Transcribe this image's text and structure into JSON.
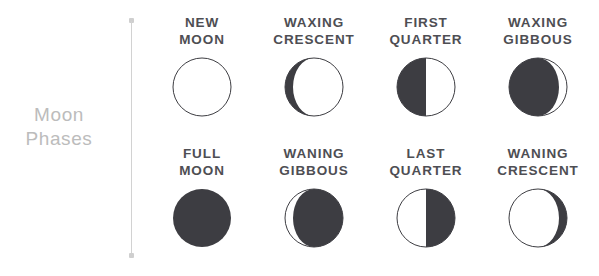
{
  "title": {
    "line1": "Moon",
    "line2": "Phases",
    "color": "#bcbcbc"
  },
  "divider": {
    "line_color": "#d2d2d2",
    "dot_color": "#cfcfcf"
  },
  "colors": {
    "dark_fill": "#3d3d42",
    "outline": "#3d3d42",
    "label": "#4e4e53",
    "background": "#ffffff"
  },
  "phases": [
    {
      "label_line1": "NEW",
      "label_line2": "MOON",
      "icon": "new-moon-icon",
      "illumination": 0,
      "shape": "empty-circle"
    },
    {
      "label_line1": "WAXING",
      "label_line2": "CRESCENT",
      "icon": "waxing-crescent-moon-icon",
      "illumination": 15,
      "shape": "dark-with-light-sliver-right"
    },
    {
      "label_line1": "FIRST",
      "label_line2": "QUARTER",
      "icon": "first-quarter-moon-icon",
      "illumination": 50,
      "shape": "left-half-dark"
    },
    {
      "label_line1": "WAXING",
      "label_line2": "GIBBOUS",
      "icon": "waxing-gibbous-moon-icon",
      "illumination": 85,
      "shape": "light-with-dark-sliver-left"
    },
    {
      "label_line1": "FULL",
      "label_line2": "MOON",
      "icon": "full-moon-icon",
      "illumination": 100,
      "shape": "filled-circle"
    },
    {
      "label_line1": "WANING",
      "label_line2": "GIBBOUS",
      "icon": "waning-gibbous-moon-icon",
      "illumination": 85,
      "shape": "light-with-dark-sliver-right"
    },
    {
      "label_line1": "LAST",
      "label_line2": "QUARTER",
      "icon": "last-quarter-moon-icon",
      "illumination": 50,
      "shape": "right-half-dark"
    },
    {
      "label_line1": "WANING",
      "label_line2": "CRESCENT",
      "icon": "waning-crescent-moon-icon",
      "illumination": 15,
      "shape": "dark-with-light-sliver-left"
    }
  ]
}
